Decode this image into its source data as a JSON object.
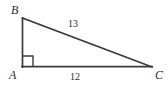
{
  "figure": {
    "kind": "right-triangle-diagram",
    "width": 168,
    "height": 86,
    "background_color": "#ffffff",
    "stroke_color": "#3a3a3a",
    "text_color": "#2b2b2b",
    "vertices": {
      "A": {
        "label": "A",
        "x": 22,
        "y": 67
      },
      "B": {
        "label": "B",
        "x": 22,
        "y": 18
      },
      "C": {
        "label": "C",
        "x": 152,
        "y": 67
      }
    },
    "sides": {
      "hypotenuse": {
        "label": "13",
        "from": "B",
        "to": "C"
      },
      "base": {
        "label": "12",
        "from": "A",
        "to": "C"
      },
      "leg": {
        "label": "",
        "from": "A",
        "to": "B"
      }
    },
    "right_angle": {
      "at_vertex": "A",
      "marker": "square",
      "size": 11
    }
  }
}
